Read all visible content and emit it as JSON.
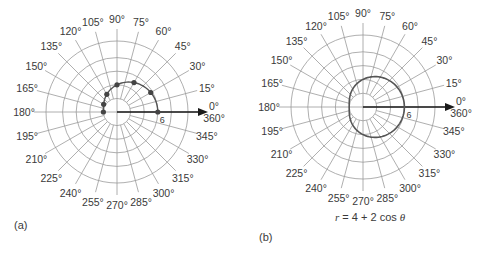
{
  "chart_data": [
    {
      "type": "scatter",
      "coordinate_system": "polar",
      "title": "",
      "panel_label": "(a)",
      "angle_tick_labels": [
        "0°\n360°",
        "15°",
        "30°",
        "45°",
        "60°",
        "75°",
        "90°",
        "105°",
        "120°",
        "135°",
        "150°",
        "165°",
        "180°",
        "195°",
        "210°",
        "225°",
        "240°",
        "255°",
        "270°",
        "285°",
        "300°",
        "315°",
        "330°",
        "345°"
      ],
      "angles_deg": [
        0,
        15,
        30,
        45,
        60,
        75,
        90,
        105,
        120,
        135,
        150,
        165,
        180,
        195,
        210,
        225,
        240,
        255,
        270,
        285,
        300,
        315,
        330,
        345
      ],
      "radial_rings": [
        2,
        4,
        6,
        8,
        10
      ],
      "radial_annotation": "6",
      "grid": true,
      "polar_axis_arrow": true,
      "series": [
        {
          "name": "plotted points",
          "theta_deg": [
            0,
            30,
            60,
            90,
            120,
            150,
            180
          ],
          "r": [
            6,
            5.73,
            5,
            4,
            3,
            2.27,
            2
          ],
          "connected": true,
          "markers": true
        }
      ]
    },
    {
      "type": "line",
      "coordinate_system": "polar",
      "title": "r = 4 + 2 cos θ",
      "panel_label": "(b)",
      "angle_tick_labels": [
        "0°\n360°",
        "15°",
        "30°",
        "45°",
        "60°",
        "75°",
        "90°",
        "105°",
        "120°",
        "135°",
        "150°",
        "165°",
        "180°",
        "195°",
        "210°",
        "225°",
        "240°",
        "255°",
        "270°",
        "285°",
        "300°",
        "315°",
        "330°",
        "345°"
      ],
      "angles_deg": [
        0,
        15,
        30,
        45,
        60,
        75,
        90,
        105,
        120,
        135,
        150,
        165,
        180,
        195,
        210,
        225,
        240,
        255,
        270,
        285,
        300,
        315,
        330,
        345
      ],
      "radial_rings": [
        2,
        4,
        6,
        8,
        10
      ],
      "radial_annotation": "6",
      "grid": true,
      "polar_axis_arrow": true,
      "series": [
        {
          "name": "r = 4 + 2 cos θ",
          "theta_deg": [
            0,
            30,
            60,
            90,
            120,
            150,
            180,
            210,
            240,
            270,
            300,
            330,
            360
          ],
          "r": [
            6,
            5.73,
            5,
            4,
            3,
            2.27,
            2,
            2.27,
            3,
            4,
            5,
            5.73,
            6
          ],
          "connected": true,
          "markers": false
        }
      ]
    }
  ],
  "panels": {
    "a": {
      "label": "(a)",
      "radial_label": "6"
    },
    "b": {
      "label": "(b)",
      "radial_label": "6",
      "equation_r": "r",
      "equation_rest": " = 4 + 2 cos ",
      "equation_theta": "θ"
    }
  },
  "style": {
    "grid_color": "#9a9a9a",
    "curve_color": "#555555",
    "axis_color": "#1a1a1a",
    "marker_color": "#444444"
  }
}
